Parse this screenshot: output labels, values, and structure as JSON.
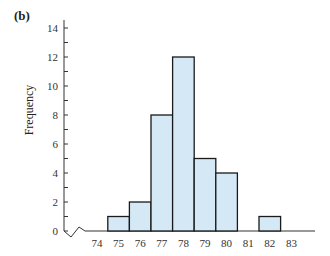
{
  "panel_label": "(b)",
  "chart_data": {
    "type": "bar",
    "title": "",
    "xlabel": "",
    "ylabel": "Frequency",
    "categories": [
      "74",
      "75",
      "76",
      "77",
      "78",
      "79",
      "80",
      "81",
      "82",
      "83"
    ],
    "values": [
      0,
      1,
      2,
      8,
      12,
      5,
      4,
      0,
      1,
      0
    ],
    "ylim": [
      0,
      14
    ],
    "yticks": [
      0,
      2,
      4,
      6,
      8,
      10,
      12,
      14
    ],
    "xticks": [
      "74",
      "75",
      "76",
      "77",
      "78",
      "79",
      "80",
      "81",
      "82",
      "83"
    ],
    "grid": false,
    "axis_break": true,
    "bar_color": "#d4e8f6",
    "edge_color": "#1a1a1a"
  }
}
